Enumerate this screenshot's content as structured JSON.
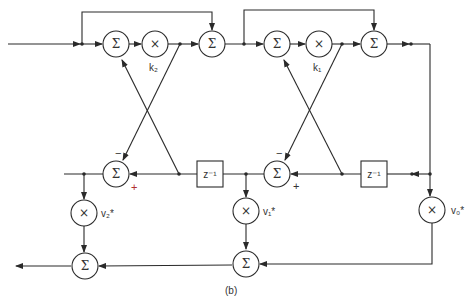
{
  "diagram": {
    "type": "lattice-ladder filter signal flow graph",
    "caption": "(b)",
    "symbols": {
      "sum": "Σ",
      "multiply": "×",
      "delay": "z⁻¹"
    },
    "stages": [
      {
        "coefficient": "k₂",
        "label": "k2"
      },
      {
        "coefficient": "k₁",
        "label": "k1"
      }
    ],
    "ladder_coefficients": [
      "v₂*",
      "v₁*",
      "v₀*"
    ],
    "signs": {
      "minus": "−",
      "plus": "+"
    },
    "colors": {
      "line": "#2a2a2a",
      "plus_sign_stage2": "#b03030",
      "plus_sign_stage1": "#333333",
      "background": "#ffffff"
    }
  }
}
